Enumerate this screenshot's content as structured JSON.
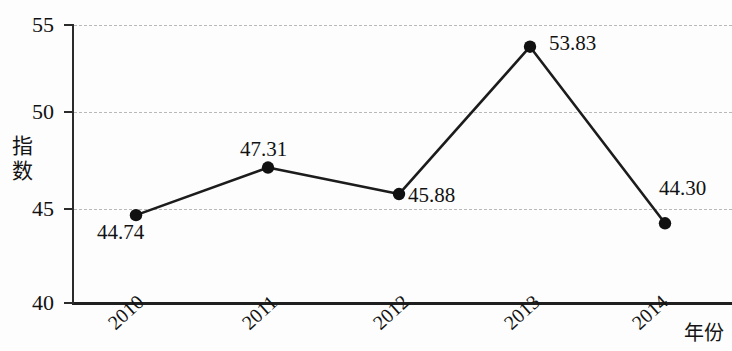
{
  "chart_data": {
    "type": "line",
    "title": "",
    "xlabel": "年份",
    "ylabel": "指数",
    "categories": [
      "2010",
      "2011",
      "2012",
      "2013",
      "2014"
    ],
    "values": [
      44.74,
      47.31,
      45.88,
      53.83,
      44.3
    ],
    "series": [
      {
        "name": "指数",
        "values": [
          44.74,
          47.31,
          45.88,
          53.83,
          44.3
        ]
      }
    ],
    "point_labels": [
      "44.74",
      "47.31",
      "45.88",
      "53.83",
      "44.30"
    ],
    "ylim": [
      40,
      55
    ],
    "yticks": [
      40,
      45,
      50,
      55
    ],
    "ytick_labels": [
      "40",
      "45",
      "50",
      "55"
    ],
    "grid": true,
    "gridlines_at": [
      45,
      50,
      55
    ],
    "legend": false,
    "legend_position": "none",
    "marker": "filled-circle",
    "line_color": "#1c1c1c",
    "marker_color": "#111111",
    "grid_color": "#b9b9b9",
    "axis_color": "#1f1f1f"
  },
  "axes": {
    "y_title_chars": [
      "指",
      "数"
    ],
    "x_title": "年份"
  }
}
